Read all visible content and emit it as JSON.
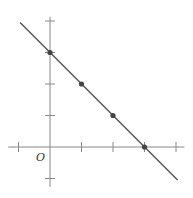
{
  "chart_data": {
    "type": "line",
    "title": "",
    "xlabel": "",
    "ylabel": "",
    "origin_label": "O",
    "x": [
      0,
      1,
      2,
      3
    ],
    "series": [
      {
        "name": "line",
        "values": [
          3,
          2,
          1,
          0
        ],
        "equation": "y = 3 - x"
      }
    ],
    "points": [
      [
        0,
        3
      ],
      [
        1,
        2
      ],
      [
        2,
        1
      ],
      [
        3,
        0
      ]
    ],
    "x_ticks": [
      -1,
      0,
      1,
      2,
      3,
      4
    ],
    "y_ticks": [
      -1,
      0,
      1,
      2,
      3,
      4
    ],
    "xlim": [
      -1.2,
      4.2
    ],
    "ylim": [
      -1.2,
      4.2
    ],
    "grid": false,
    "legend": false,
    "colors": {
      "line": "#555555",
      "axis": "#888888",
      "point": "#444444"
    }
  }
}
